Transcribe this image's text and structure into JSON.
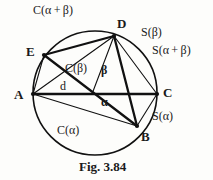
{
  "figure": {
    "caption": "Fig. 3.84",
    "stroke_color": "#111111",
    "background_color": "#fdfdfb",
    "circle": {
      "cx": 95,
      "cy": 93,
      "r": 62
    },
    "vertices": [
      {
        "id": "A",
        "label": "A",
        "x": 33,
        "y": 94,
        "label_x": 14,
        "label_y": 88
      },
      {
        "id": "B",
        "label": "B",
        "x": 137,
        "y": 126,
        "label_x": 141,
        "label_y": 130
      },
      {
        "id": "C",
        "label": "C",
        "x": 157,
        "y": 94,
        "label_x": 163,
        "label_y": 86
      },
      {
        "id": "D",
        "label": "D",
        "x": 114,
        "y": 36,
        "label_x": 117,
        "label_y": 17
      },
      {
        "id": "E",
        "label": "E",
        "x": 44,
        "y": 55,
        "label_x": 26,
        "label_y": 45
      },
      {
        "id": "F",
        "label": "",
        "x": 92,
        "y": 94,
        "label_x": 0,
        "label_y": 0
      }
    ],
    "chord_labels": [
      {
        "name": "c-alpha-plus-beta",
        "text": "C(α + β)",
        "x": 33,
        "y": 4
      },
      {
        "name": "s-beta",
        "text": "S(β)",
        "x": 141,
        "y": 26
      },
      {
        "name": "s-alpha-plus-beta",
        "text": "S(α + β)",
        "x": 152,
        "y": 44
      },
      {
        "name": "s-alpha",
        "text": "S(α)",
        "x": 152,
        "y": 110
      },
      {
        "name": "c-beta",
        "text": "C(β)",
        "x": 65,
        "y": 62
      },
      {
        "name": "c-alpha",
        "text": "C(α)",
        "x": 57,
        "y": 124
      },
      {
        "name": "d-segment",
        "text": "d",
        "x": 60,
        "y": 80
      }
    ],
    "angle_labels": [
      {
        "name": "angle-beta",
        "text": "β",
        "x": 101,
        "y": 64
      },
      {
        "name": "angle-alpha",
        "text": "α",
        "x": 101,
        "y": 96
      }
    ],
    "edges": [
      {
        "name": "edge-A-C",
        "from": "A",
        "to": "C",
        "weight": "thick"
      },
      {
        "name": "edge-A-B",
        "from": "A",
        "to": "B",
        "weight": "thin"
      },
      {
        "name": "edge-A-D",
        "from": "A",
        "to": "D",
        "weight": "thin"
      },
      {
        "name": "edge-A-E",
        "from": "A",
        "to": "E",
        "weight": "thin"
      },
      {
        "name": "edge-E-B",
        "from": "E",
        "to": "B",
        "weight": "thick"
      },
      {
        "name": "edge-E-D",
        "from": "E",
        "to": "D",
        "weight": "thick"
      },
      {
        "name": "edge-D-B",
        "from": "D",
        "to": "B",
        "weight": "thick"
      },
      {
        "name": "edge-D-C",
        "from": "D",
        "to": "C",
        "weight": "thin"
      },
      {
        "name": "edge-D-F",
        "from": "D",
        "to": "F",
        "weight": "thin"
      },
      {
        "name": "edge-B-C",
        "from": "B",
        "to": "C",
        "weight": "thin"
      }
    ]
  },
  "bleed_text": {
    "top_right": "",
    "bottom_a": "",
    "bottom_b": ""
  }
}
